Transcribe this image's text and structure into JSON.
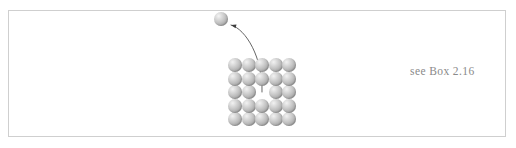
{
  "figure": {
    "caption_text": "see Box 2.16",
    "background_color": "#ffffff",
    "frame_color": "#cfcfcf",
    "caption_color": "#8a8a8a",
    "atom_color": "#b4b4b4",
    "atom_highlight_color": "#f2f2f2",
    "atom_shadow_color": "#7d7d7d",
    "arrow_color": "#555555"
  },
  "lattice": {
    "rows": 5,
    "columns": 5,
    "atom_diameter_px": 14,
    "spacing_px": 13.5,
    "vacancy": {
      "row": 3,
      "column": 3
    },
    "origin": {
      "x": 228,
      "y": 58
    }
  },
  "free_atom": {
    "label": "ejected-atom",
    "x": 214,
    "y": 12,
    "diameter_px": 14
  },
  "arrow": {
    "label": "migration-path",
    "start": {
      "x": 262,
      "y": 92
    },
    "end": {
      "x": 231,
      "y": 25
    },
    "head": "pointing-up-left"
  }
}
